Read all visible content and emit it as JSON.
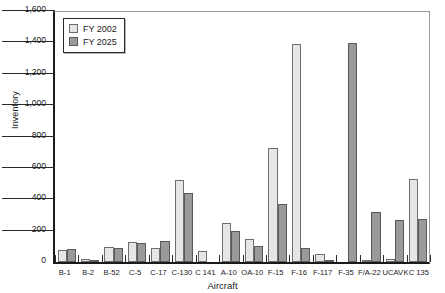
{
  "chart_data": {
    "type": "bar",
    "title": "",
    "xlabel": "Aircraft",
    "ylabel": "Inventory",
    "ylim": [
      0,
      1600
    ],
    "yticks": [
      0,
      200,
      400,
      600,
      800,
      1000,
      1200,
      1400,
      1600
    ],
    "ytick_labels": [
      "0",
      "200",
      "400",
      "600",
      "800",
      "1,000",
      "1,200",
      "1,400",
      "1,600"
    ],
    "grid": false,
    "legend_position": "upper left",
    "categories": [
      "B-1",
      "B-2",
      "B-52",
      "C-5",
      "C-17",
      "C-130",
      "C 141",
      "A-10",
      "OA-10",
      "F-15",
      "F-16",
      "F-117",
      "F-35",
      "F/A-22",
      "UCAV",
      "KC 135"
    ],
    "series": [
      {
        "name": "FY 2002",
        "color": "#e6e6e6",
        "values": [
          75,
          20,
          95,
          125,
          90,
          520,
          70,
          250,
          145,
          725,
          1390,
          50,
          0,
          10,
          20,
          530
        ]
      },
      {
        "name": "FY 2025",
        "color": "#9a9a9a",
        "values": [
          80,
          15,
          90,
          122,
          135,
          440,
          0,
          200,
          105,
          370,
          90,
          5,
          1395,
          320,
          270,
          275
        ]
      }
    ]
  },
  "legend": {
    "entries": [
      {
        "label": "FY 2002"
      },
      {
        "label": "FY 2025"
      }
    ]
  },
  "axes": {
    "y_title": "Inventory",
    "x_title": "Aircraft"
  }
}
